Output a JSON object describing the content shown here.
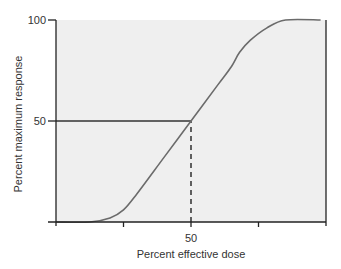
{
  "chart_data": {
    "type": "line",
    "title": "",
    "xlabel": "Percent effective dose",
    "ylabel": "Percent maximum response",
    "xlim": [
      0,
      100
    ],
    "ylim": [
      0,
      100
    ],
    "x_ticks": [
      0,
      25,
      50,
      75,
      100
    ],
    "x_tick_labels": [
      "",
      "",
      "50",
      "",
      ""
    ],
    "y_ticks": [
      0,
      50,
      100
    ],
    "y_tick_labels": [
      "",
      "50",
      "100"
    ],
    "grid": false,
    "legend": "none",
    "series": [
      {
        "name": "dose-response curve",
        "x": [
          0,
          12.5,
          20,
          25,
          30,
          40,
          50,
          60,
          65,
          68,
          72,
          78,
          85,
          98
        ],
        "y": [
          0,
          0,
          2,
          6,
          14,
          32,
          50,
          68,
          77,
          84,
          90,
          96,
          100,
          100
        ]
      }
    ],
    "annotations": [
      {
        "type": "reference-line-horizontal",
        "style": "solid",
        "from_x": 0,
        "to_x": 50,
        "y": 50
      },
      {
        "type": "reference-line-vertical",
        "style": "dashed",
        "x": 50,
        "from_y": 0,
        "to_y": 50
      }
    ],
    "colors": {
      "plot_background": "#efefef",
      "curve": "#6b6b6b",
      "axis": "#222222",
      "text": "#333333"
    }
  }
}
